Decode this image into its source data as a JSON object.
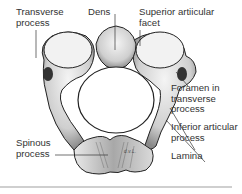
{
  "figure": {
    "labels": {
      "transverse_process": "Transverse\nprocess",
      "dens": "Dens",
      "superior_articular_facet": "Superior artiicular\nfacet",
      "foramen_transverse": "Foramen in\ntransverse\nprocess",
      "inferior_articular_process": "Inferior articular\nprocess",
      "spinous_process": "Spinous\nprocess",
      "lamina": "Lamina"
    },
    "signature": "d.v.L.",
    "colors": {
      "bone_light": "#efefef",
      "bone_shade": "#9a9a9a",
      "outline": "#222222",
      "leader_line": "#333333",
      "divider": "#cfcfcf"
    }
  }
}
